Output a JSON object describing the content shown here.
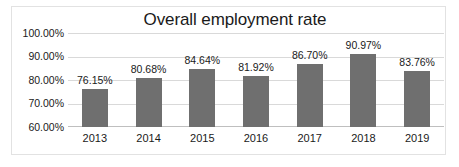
{
  "chart_data": {
    "type": "bar",
    "title": "Overall employment rate",
    "xlabel": "",
    "ylabel": "",
    "categories": [
      "2013",
      "2014",
      "2015",
      "2016",
      "2017",
      "2018",
      "2019"
    ],
    "values": [
      76.15,
      80.68,
      84.64,
      81.92,
      86.7,
      90.97,
      83.76
    ],
    "data_labels": [
      "76.15%",
      "80.68%",
      "84.64%",
      "81.92%",
      "86.70%",
      "90.97%",
      "83.76%"
    ],
    "ylim": [
      60,
      100
    ],
    "y_ticks": [
      100,
      90,
      80,
      70,
      60
    ],
    "y_tick_labels": [
      "100.00%",
      "90.00%",
      "80.00%",
      "70.00%",
      "60.00%"
    ],
    "grid": true,
    "legend": null,
    "series": [
      {
        "name": "Overall employment rate",
        "values": [
          76.15,
          80.68,
          84.64,
          81.92,
          86.7,
          90.97,
          83.76
        ]
      }
    ],
    "colors": {
      "bar": "#6f6f6f",
      "gridline": "#d9d9d9",
      "axis": "#bfbfbf",
      "text": "#1a1a1a",
      "frame": "#e2e2e2",
      "background": "#ffffff"
    }
  }
}
